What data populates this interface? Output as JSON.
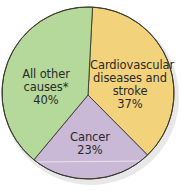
{
  "chart_data": {
    "type": "pie",
    "title": "",
    "start_angle_deg": 3,
    "direction": "clockwise",
    "slices": [
      {
        "label": "Cardiovascular diseases and stroke",
        "label_lines": [
          "Cardiovascular",
          "diseases and",
          "stroke"
        ],
        "value": 37,
        "value_label": "37%",
        "color": "#f3d27c"
      },
      {
        "label": "Cancer",
        "label_lines": [
          "Cancer"
        ],
        "value": 23,
        "value_label": "23%",
        "color": "#c9b8d6"
      },
      {
        "label": "All other causes*",
        "label_lines": [
          "All other",
          "causes*"
        ],
        "value": 40,
        "value_label": "40%",
        "color": "#b5d99a"
      }
    ],
    "categories": [
      "Cardiovascular diseases and stroke",
      "Cancer",
      "All other causes*"
    ],
    "values": [
      37,
      23,
      40
    ],
    "unit": "%"
  },
  "style": {
    "outline_color": "#3a3a2e",
    "shadow_color": "#d8d8d8"
  }
}
